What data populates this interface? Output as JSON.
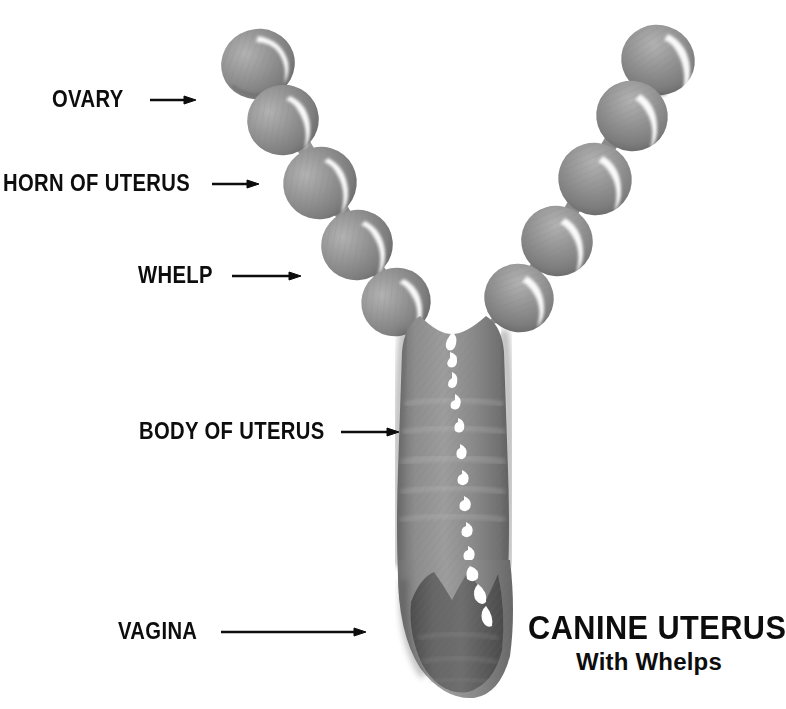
{
  "figure": {
    "kind": "anatomical-illustration",
    "background_color": "#ffffff",
    "tissue_color": "#8e8e8e",
    "tissue_shadow_color": "#6f6f6f",
    "tissue_light_color": "#a9a9a9",
    "vagina_color": "#636363",
    "highlight_color": "#ffffff",
    "outline_color": "#5a5a5a",
    "ink_color": "#0d0d0d"
  },
  "labels": [
    {
      "id": "ovary",
      "text": "OVARY",
      "arrow_from_x": 150,
      "arrow_to_x": 196,
      "arrow_y": 100
    },
    {
      "id": "horn",
      "text": "HORN OF UTERUS",
      "arrow_from_x": 212,
      "arrow_to_x": 259,
      "arrow_y": 184
    },
    {
      "id": "whelp",
      "text": "WHELP",
      "arrow_from_x": 232,
      "arrow_to_x": 301,
      "arrow_y": 276
    },
    {
      "id": "body",
      "text": "BODY OF UTERUS",
      "arrow_from_x": 341,
      "arrow_to_x": 399,
      "arrow_y": 432
    },
    {
      "id": "vagina",
      "text": "VAGINA",
      "arrow_from_x": 221,
      "arrow_to_x": 366,
      "arrow_y": 632
    }
  ],
  "title": {
    "main": "CANINE UTERUS",
    "sub": "With Whelps"
  },
  "anatomy": {
    "left_horn": {
      "ovary_count": 1,
      "whelp_count": 4,
      "whelps": [
        {
          "cx": 281,
          "cy": 118,
          "r": 34
        },
        {
          "cx": 318,
          "cy": 180,
          "r": 35
        },
        {
          "cx": 355,
          "cy": 243,
          "r": 34
        },
        {
          "cx": 394,
          "cy": 300,
          "r": 33
        }
      ],
      "ovary": {
        "cx": 256,
        "cy": 62,
        "rx": 35,
        "ry": 33
      }
    },
    "right_horn": {
      "ovary_count": 1,
      "whelp_count": 4,
      "whelps": [
        {
          "cx": 634,
          "cy": 113,
          "r": 33
        },
        {
          "cx": 597,
          "cy": 176,
          "r": 34
        },
        {
          "cx": 557,
          "cy": 238,
          "r": 34
        },
        {
          "cx": 518,
          "cy": 296,
          "r": 33
        }
      ],
      "ovary": {
        "cx": 658,
        "cy": 57,
        "rx": 34,
        "ry": 33
      }
    },
    "body": {
      "top_y": 325,
      "bottom_y": 560,
      "left_x": 400,
      "right_x": 505
    },
    "vagina": {
      "top_y": 565,
      "bottom_y": 700,
      "left_x": 398,
      "right_x": 512
    }
  }
}
